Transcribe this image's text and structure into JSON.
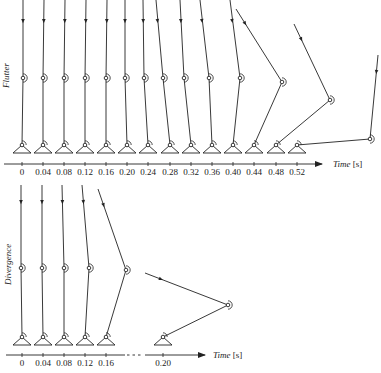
{
  "panels": [
    {
      "name": "flutter",
      "label": "Flutter",
      "axis_label": "Time",
      "axis_unit": "[s]",
      "ticks": [
        "0",
        "0.04",
        "0.08",
        "0.12",
        "0.16",
        "0.20",
        "0.24",
        "0.28",
        "0.32",
        "0.36",
        "0.40",
        "0.44",
        "0.48",
        "0.52"
      ]
    },
    {
      "name": "divergence",
      "label": "Divergence",
      "axis_label": "Time",
      "axis_unit": "[s]",
      "ticks": [
        "0",
        "0.04",
        "0.08",
        "0.12",
        "0.16",
        "0.20"
      ]
    }
  ],
  "flutter_frames": [
    {
      "t": "0",
      "top": [
        23,
        0
      ],
      "mid": [
        23,
        78
      ],
      "piv": [
        22,
        145
      ]
    },
    {
      "t": "0.04",
      "top": [
        44,
        0
      ],
      "mid": [
        43,
        78
      ],
      "piv": [
        43,
        145
      ]
    },
    {
      "t": "0.08",
      "top": [
        65,
        0
      ],
      "mid": [
        64,
        78
      ],
      "piv": [
        64,
        145
      ]
    },
    {
      "t": "0.12",
      "top": [
        86,
        0
      ],
      "mid": [
        85,
        78
      ],
      "piv": [
        85,
        145
      ]
    },
    {
      "t": "0.16",
      "top": [
        107,
        0
      ],
      "mid": [
        106,
        78
      ],
      "piv": [
        106,
        145
      ]
    },
    {
      "t": "0.20",
      "top": [
        125,
        0
      ],
      "mid": [
        125,
        78
      ],
      "piv": [
        127,
        145
      ]
    },
    {
      "t": "0.24",
      "top": [
        143,
        0
      ],
      "mid": [
        144,
        78
      ],
      "piv": [
        148,
        145
      ]
    },
    {
      "t": "0.28",
      "top": [
        156,
        0
      ],
      "mid": [
        163,
        78
      ],
      "piv": [
        170,
        145
      ]
    },
    {
      "t": "0.32",
      "top": [
        180,
        0
      ],
      "mid": [
        184,
        78
      ],
      "piv": [
        191,
        145
      ]
    },
    {
      "t": "0.36",
      "top": [
        200,
        0
      ],
      "mid": [
        209,
        78
      ],
      "piv": [
        212,
        145
      ]
    },
    {
      "t": "0.40",
      "top": [
        230,
        0
      ],
      "mid": [
        240,
        78
      ],
      "piv": [
        233,
        145
      ]
    },
    {
      "t": "0.44",
      "top": [
        236,
        9
      ],
      "mid": [
        282,
        82
      ],
      "piv": [
        254,
        145
      ]
    },
    {
      "t": "0.48",
      "top": [
        294,
        24
      ],
      "mid": [
        330,
        100
      ],
      "piv": [
        276,
        145
      ]
    },
    {
      "t": "0.52",
      "top": [
        378,
        55
      ],
      "mid": [
        370,
        139
      ],
      "piv": [
        297,
        145
      ]
    }
  ],
  "divergence_frames": [
    {
      "t": "0",
      "top": [
        21,
        185
      ],
      "mid": [
        21,
        268
      ],
      "piv": [
        22,
        337
      ]
    },
    {
      "t": "0.04",
      "top": [
        42,
        185
      ],
      "mid": [
        42,
        268
      ],
      "piv": [
        43,
        337
      ]
    },
    {
      "t": "0.08",
      "top": [
        62,
        185
      ],
      "mid": [
        64,
        268
      ],
      "piv": [
        64,
        337
      ]
    },
    {
      "t": "0.12",
      "top": [
        82,
        185
      ],
      "mid": [
        89,
        268
      ],
      "piv": [
        85,
        337
      ]
    },
    {
      "t": "0.16",
      "top": [
        98,
        189
      ],
      "mid": [
        126,
        270
      ],
      "piv": [
        106,
        337
      ]
    },
    {
      "t": "0.20",
      "top": [
        145,
        273
      ],
      "mid": [
        228,
        305
      ],
      "piv": [
        163,
        337
      ]
    }
  ],
  "colors": {
    "ink": "#222222",
    "background": "#ffffff"
  }
}
